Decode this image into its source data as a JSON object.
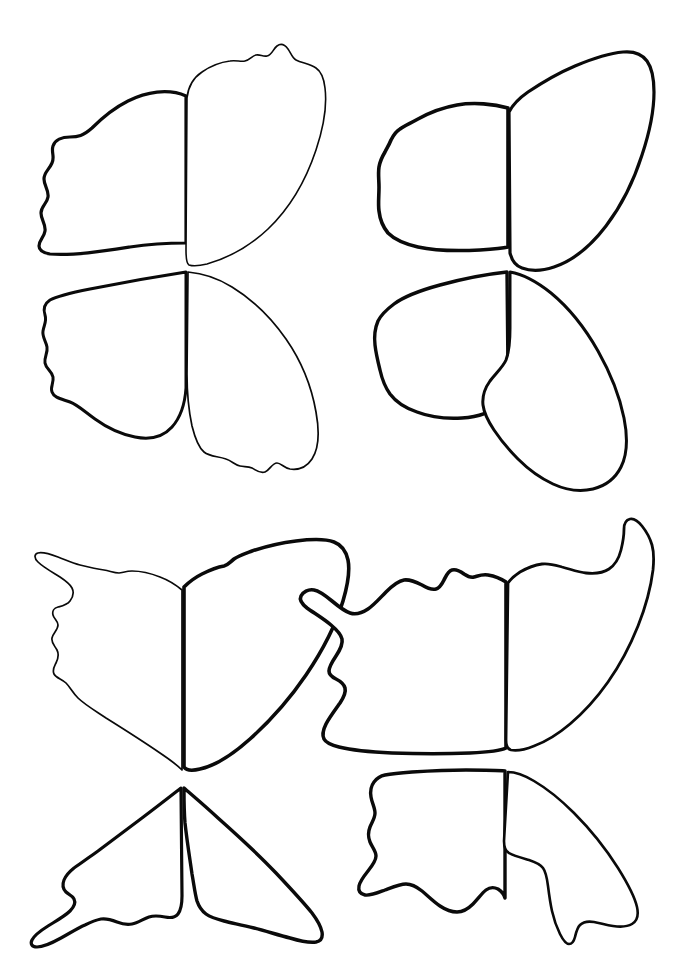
{
  "document": {
    "title": "Butterfly Wing Templates",
    "kind": "line-art-template-sheet",
    "description": "Black ink outline drawing sheet containing four butterfly wing-pair templates arranged in a 2x2 grid on a plain white background.",
    "background_color": "#ffffff",
    "ink_color": "#0a0a0a",
    "canvas": {
      "width": 675,
      "height": 963
    }
  },
  "figures": [
    {
      "id": "butterfly-top-left",
      "label": "Butterfly Top Left",
      "position": "top-left",
      "body_axis_x": 186,
      "body_axis_top_y": 92,
      "body_axis_bottom_y": 480,
      "wings": [
        {
          "id": "top-left-forewing-left",
          "label": "Upper Left Forewing",
          "stroke_weight": 3.2,
          "edge": "scalloped-outer-margin",
          "path": "M 186 96 C 168 88 146 92 128 101 C 112 109 100 120 92 128 C 83 136 78 137 70 137 C 62 137 55 140 53 146 C 51 152 55 157 52 163 C 49 170 44 172 44 179 C 44 186 49 190 48 197 C 47 204 41 206 41 213 C 41 220 46 224 45 231 C 44 238 39 240 39 246 C 39 251 44 253 50 254 C 72 256 104 251 130 247 C 156 243 176 243 186 243 Z"
        },
        {
          "id": "top-left-hindwing-left",
          "label": "Upper Right Forewing",
          "stroke_weight": 1.6,
          "edge": "bumpy-upper-margin",
          "path": "M 187 98 C 188 88 193 78 202 72 C 212 65 222 62 230 61 C 236 60 241 62 245 61 C 250 60 252 56 256 55 C 260 54 263 57 267 56 C 272 55 273 49 277 46 C 281 43 285 45 288 49 C 291 53 292 58 296 60 C 302 63 310 64 316 68 C 322 72 324 79 325 88 C 327 104 324 126 316 150 C 306 180 290 208 268 229 C 250 246 228 258 207 264 C 199 266 192 266 189 265 C 187 264 186 258 186 250 Z"
        },
        {
          "id": "top-left-forewing-right",
          "label": "Lower Left Hindwing",
          "stroke_weight": 3.0,
          "edge": "scalloped-outer-margin",
          "path": "M 186 272 C 160 276 120 283 90 289 C 70 293 57 296 50 300 C 44 304 43 309 45 315 C 47 321 44 325 43 331 C 42 337 46 341 47 347 C 48 353 44 357 45 363 C 46 369 52 371 53 377 C 54 383 50 387 52 392 C 54 398 62 399 70 402 C 78 405 85 412 95 419 C 106 427 120 434 135 437 C 150 440 163 437 172 427 C 180 418 185 403 186 388 Z"
        },
        {
          "id": "top-left-hindwing-right",
          "label": "Lower Right Hindwing",
          "stroke_weight": 1.7,
          "edge": "bumpy-lower-margin",
          "path": "M 188 272 C 200 273 216 277 232 287 C 250 298 270 316 286 339 C 302 362 312 389 316 412 C 320 434 318 450 312 459 C 306 468 297 470 290 469 C 284 468 281 463 277 463 C 272 463 270 470 265 472 C 260 474 256 470 252 468 C 248 466 244 467 240 466 C 235 465 232 461 226 459 C 218 456 210 457 204 452 C 198 447 195 438 192 426 C 189 412 187 392 187 374 Z"
        }
      ]
    },
    {
      "id": "butterfly-top-right",
      "label": "Butterfly Top Right",
      "position": "top-right",
      "body_axis_x": 508,
      "body_axis_top_y": 95,
      "body_axis_bottom_y": 500,
      "wings": [
        {
          "id": "top-right-forewing-left",
          "label": "Upper Left Forewing",
          "stroke_weight": 3.6,
          "edge": "smooth-rounded-margin",
          "path": "M 508 108 C 494 104 474 102 457 105 C 440 108 427 114 418 119 C 409 124 404 126 400 129 C 395 132 393 136 391 140 C 389 145 387 148 385 152 C 382 157 380 161 379 167 C 378 174 379 180 379 187 C 379 196 378 204 379 211 C 380 220 383 227 388 233 C 395 240 405 244 418 247 C 436 251 460 251 480 250 C 495 249 504 248 508 247 Z"
        },
        {
          "id": "top-right-hindwing-left",
          "label": "Upper Right Forewing",
          "stroke_weight": 3.2,
          "edge": "smooth-long-curve",
          "path": "M 509 112 C 512 106 518 99 528 92 C 540 84 556 74 575 66 C 594 58 611 53 623 52 C 634 51 642 54 647 61 C 652 68 654 79 654 92 C 654 109 650 131 642 155 C 634 180 622 205 606 226 C 590 247 572 261 554 267 C 542 271 530 271 522 268 C 516 266 512 261 510 253 Z"
        },
        {
          "id": "top-right-forewing-right",
          "label": "Lower Left Hindwing",
          "stroke_weight": 3.4,
          "edge": "smooth-rounded-margin",
          "path": "M 507 272 C 488 274 462 279 440 285 C 418 291 402 298 394 304 C 386 310 381 315 378 321 C 375 328 374 336 375 345 C 376 354 378 362 380 370 C 382 379 385 387 390 394 C 396 402 405 408 417 412 C 430 417 446 419 462 418 C 478 417 492 412 500 404 C 506 397 508 385 508 372 Z"
        },
        {
          "id": "top-right-hindwing-right",
          "label": "Lower Right Hindwing",
          "stroke_weight": 3.0,
          "edge": "smooth-long-curve",
          "path": "M 510 272 C 522 274 536 281 551 293 C 568 307 585 328 598 351 C 611 374 620 398 624 418 C 628 438 627 455 621 467 C 615 479 605 486 593 489 C 580 492 566 490 553 484 C 540 478 528 469 518 459 C 508 449 500 439 494 430 C 488 421 484 413 483 405 C 482 396 485 388 490 381 C 496 373 503 367 506 360 C 509 352 510 340 510 328 Z"
        }
      ]
    },
    {
      "id": "butterfly-bottom-left",
      "label": "Butterfly Bottom Left",
      "position": "bottom-left",
      "body_axis_x": 182,
      "body_axis_top_y": 560,
      "body_axis_bottom_y": 920,
      "wings": [
        {
          "id": "bottom-left-forewing-left",
          "label": "Upper Left Forewing",
          "stroke_weight": 1.7,
          "edge": "scalloped-with-tail-hook",
          "path": "M 182 590 C 176 585 168 580 160 577 C 150 573 140 571 132 571 C 126 571 122 573 119 573 C 114 573 110 571 104 570 C 96 569 88 567 80 565 C 72 563 66 560 58 557 C 50 554 42 552 38 553 C 34 554 34 558 38 562 C 43 567 52 572 60 577 C 66 581 70 584 72 588 C 74 592 73 597 70 601 C 67 605 62 606 58 607 C 54 608 52 611 53 615 C 54 619 58 621 58 625 C 58 630 53 633 52 638 C 51 643 55 646 57 650 C 59 654 58 659 56 663 C 54 667 52 670 54 674 C 56 678 62 679 66 683 C 70 687 73 693 78 698 C 84 704 94 710 106 718 C 122 728 144 742 160 753 C 172 761 179 767 182 770 Z"
        },
        {
          "id": "bottom-left-hindwing-left",
          "label": "Upper Right Forewing",
          "stroke_weight": 3.6,
          "edge": "smooth-wide-sweep",
          "path": "M 184 587 C 188 583 194 578 202 574 C 210 570 218 567 224 566 C 228 565 230 562 234 559 C 238 556 244 554 252 551 C 264 547 280 543 296 541 C 312 539 326 539 334 542 C 342 545 346 551 348 560 C 350 570 348 584 343 601 C 336 624 323 650 306 675 C 289 700 269 722 250 739 C 231 756 214 766 200 769 C 192 771 186 770 184 767 Z"
        },
        {
          "id": "bottom-left-forewing-right",
          "label": "Lower Left Hindwing",
          "stroke_weight": 3.2,
          "edge": "scalloped-with-tail-hook",
          "path": "M 181 788 C 172 795 158 806 142 818 C 126 830 110 842 98 851 C 88 858 80 864 74 868 C 69 872 66 875 64 880 C 62 885 63 889 66 892 C 69 895 72 895 74 899 C 76 903 74 907 70 911 C 65 916 56 921 48 926 C 40 931 34 936 32 940 C 30 944 32 947 37 947 C 43 947 52 943 61 938 C 70 933 78 928 85 925 C 91 922 96 920 101 919 C 107 918 112 920 117 922 C 122 924 127 925 132 924 C 138 923 143 919 149 917 C 155 915 160 916 165 917 C 170 918 175 918 178 914 C 181 910 182 903 182 896 Z"
        },
        {
          "id": "bottom-left-hindwing-right",
          "label": "Lower Right Hindwing",
          "stroke_weight": 3.4,
          "edge": "smooth-wide-sweep",
          "path": "M 184 788 C 192 795 204 805 218 818 C 236 834 258 854 276 873 C 292 890 304 903 312 913 C 318 921 321 927 322 932 C 323 938 321 941 316 942 C 310 943 300 941 290 938 C 278 935 266 931 254 928 C 242 925 232 923 224 921 C 216 919 210 917 206 914 C 202 911 199 907 197 901 C 195 894 194 885 192 874 C 190 860 187 841 185 823 C 184 810 184 797 184 790 Z"
        }
      ]
    },
    {
      "id": "butterfly-bottom-right",
      "label": "Butterfly Bottom Right",
      "position": "bottom-right",
      "body_axis_x": 506,
      "body_axis_top_y": 565,
      "body_axis_bottom_y": 935,
      "wings": [
        {
          "id": "bottom-right-forewing-left",
          "label": "Upper Left Forewing",
          "stroke_weight": 3.6,
          "edge": "notched-with-pointed-tail",
          "path": "M 506 582 C 500 578 494 576 488 575 C 482 574 478 576 474 577 C 470 578 467 576 464 574 C 460 571 456 569 452 570 C 448 571 446 576 444 580 C 442 584 440 588 436 589 C 432 590 427 588 422 585 C 416 582 410 579 404 580 C 398 581 392 586 386 592 C 380 598 374 605 368 609 C 362 613 356 615 350 613 C 344 611 338 606 332 601 C 326 596 320 591 314 590 C 308 589 303 592 301 596 C 299 600 302 604 307 608 C 314 613 324 619 331 625 C 337 630 341 634 342 639 C 343 644 340 650 336 656 C 332 662 329 667 329 671 C 329 675 332 677 336 679 C 340 681 344 684 345 688 C 346 692 344 697 340 703 C 335 710 329 718 326 724 C 323 730 322 735 324 739 C 326 743 331 745 339 747 C 351 750 370 752 392 753 C 418 754 448 754 470 753 C 490 752 502 750 506 748 Z"
        },
        {
          "id": "bottom-right-hindwing-left",
          "label": "Upper Right Forewing",
          "stroke_weight": 2.8,
          "edge": "hooked-upper-tip",
          "path": "M 508 583 C 510 580 514 576 520 572 C 527 568 535 565 542 564 C 549 563 555 565 562 567 C 570 569 578 572 586 573 C 595 574 603 573 609 569 C 615 565 619 558 621 550 C 623 542 624 535 624 529 C 624 523 626 520 630 519 C 634 518 638 521 642 526 C 646 531 650 538 652 545 C 654 552 654 560 653 570 C 651 586 646 606 638 626 C 630 646 620 665 608 682 C 596 699 583 713 570 724 C 557 735 545 742 534 746 C 524 750 516 751 511 750 C 507 749 506 746 506 740 Z"
        },
        {
          "id": "bottom-right-forewing-right",
          "label": "Lower Left Hindwing",
          "stroke_weight": 3.4,
          "edge": "notched-with-pointed-tail",
          "path": "M 505 771 C 496 770 482 770 466 770 C 448 770 428 771 412 772 C 398 773 390 774 385 775 C 380 776 377 778 374 782 C 371 786 370 791 371 797 C 372 803 375 808 375 813 C 375 818 372 822 370 827 C 368 832 368 837 370 842 C 372 847 376 851 376 856 C 376 861 372 866 368 871 C 364 876 360 881 359 886 C 358 891 360 894 365 895 C 370 896 377 893 385 890 C 393 887 400 884 406 884 C 412 884 417 887 422 891 C 428 896 434 902 440 906 C 446 910 451 912 457 912 C 463 912 468 909 473 904 C 478 899 482 893 486 890 C 490 887 494 887 498 889 C 501 891 504 894 505 898 Z"
        },
        {
          "id": "bottom-right-hindwing-right",
          "label": "Lower Right Hindwing",
          "stroke_weight": 2.6,
          "edge": "long-tapered-tail",
          "path": "M 508 772 C 515 772 524 775 534 781 C 546 788 560 799 574 813 C 590 829 606 849 618 868 C 628 884 635 898 637 907 C 639 916 637 921 632 924 C 627 927 620 927 613 926 C 606 925 600 923 594 922 C 588 921 583 922 580 925 C 577 928 576 933 575 937 C 574 941 572 944 569 944 C 566 944 563 940 560 934 C 557 928 554 920 552 911 C 550 902 549 894 548 886 C 547 878 546 872 543 868 C 540 864 535 862 529 860 C 522 858 514 856 509 853 C 505 851 504 847 504 841 Z"
        }
      ]
    }
  ]
}
